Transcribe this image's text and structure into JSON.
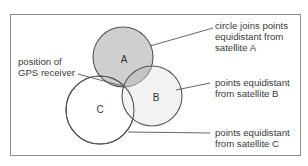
{
  "diagram": {
    "type": "gps-trilateration",
    "circles": [
      {
        "id": "A",
        "label": "A",
        "cx": 123,
        "cy": 57,
        "r": 30,
        "fill": "#cfcfcf"
      },
      {
        "id": "B",
        "label": "B",
        "cx": 152,
        "cy": 96,
        "r": 30,
        "fill": "#f2f2f2"
      },
      {
        "id": "C",
        "label": "C",
        "cx": 100,
        "cy": 110,
        "r": 34,
        "fill": "#ffffff"
      }
    ],
    "stroke_color": "#555555",
    "frame_color": "#8c8c8c",
    "annotations": {
      "gps_receiver": {
        "line1": "position of",
        "line2": "GPS receiver"
      },
      "satellite_a": {
        "line1": "circle joins points",
        "line2": "equidistant from",
        "line3": "satellite A"
      },
      "satellite_b": {
        "line1": "points equidistant",
        "line2": "from satellite B"
      },
      "satellite_c": {
        "line1": "points equidistant",
        "line2": "from satellite C"
      }
    }
  }
}
